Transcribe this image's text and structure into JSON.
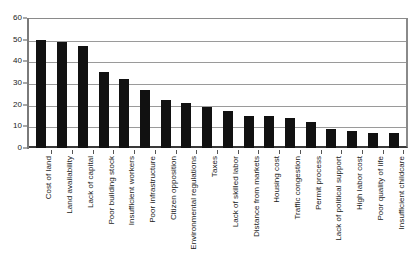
{
  "chart_data": {
    "type": "bar",
    "title": "",
    "subtitle": "",
    "xlabel": "",
    "ylabel": "",
    "ylim": [
      0,
      60
    ],
    "yticks": [
      0,
      10,
      20,
      30,
      40,
      50,
      60
    ],
    "grid": true,
    "legend": false,
    "orientation": "vertical",
    "bar_color": "#111111",
    "categories": [
      "Cost of land",
      "Land availability",
      "Lack of capital",
      "Poor building stock",
      "Insufficient workers",
      "Poor infrastructure",
      "Citizen opposition",
      "Environmental regulations",
      "Taxes",
      "Lack of skilled labor",
      "Distance from markets",
      "Housing cost",
      "Traffic congestion",
      "Permit process",
      "Lack of political support",
      "High labor cost",
      "Poor quality of life",
      "Insufficient childcare"
    ],
    "values": [
      50,
      49,
      47,
      35,
      32,
      27,
      22,
      21,
      19,
      17,
      15,
      15,
      14,
      12,
      9,
      8,
      7,
      7
    ]
  }
}
